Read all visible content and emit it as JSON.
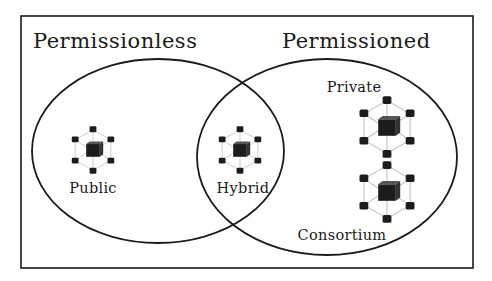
{
  "diagram": {
    "type": "venn",
    "frame": {
      "x": 21,
      "y": 16,
      "width": 452,
      "height": 252
    },
    "colors": {
      "stroke": "#1a1a1a",
      "node": "#1c1c1c",
      "link": "#bdbdbd",
      "background": "#ffffff"
    },
    "sets": [
      {
        "id": "permissionless",
        "label": "Permissionless",
        "label_x": 33,
        "label_y": 48,
        "cx": 158,
        "cy": 151,
        "rx": 126,
        "ry": 92
      },
      {
        "id": "permissioned",
        "label": "Permissioned",
        "label_x": 282,
        "label_y": 48,
        "cx": 327,
        "cy": 160,
        "rx": 130,
        "ry": 96
      }
    ],
    "items": [
      {
        "id": "public",
        "label": "Public",
        "set": "permissionless",
        "icon": "blockchain-network-icon",
        "icon_cx": 93,
        "icon_cy": 150,
        "scale": 0.85,
        "label_x": 93,
        "label_y": 192
      },
      {
        "id": "hybrid",
        "label": "Hybrid",
        "set": "intersection",
        "icon": "blockchain-network-icon",
        "icon_cx": 240,
        "icon_cy": 150,
        "scale": 0.85,
        "label_x": 243,
        "label_y": 192
      },
      {
        "id": "private",
        "label": "Private",
        "set": "permissioned",
        "icon": "blockchain-network-icon",
        "icon_cx": 387,
        "icon_cy": 126,
        "scale": 1.1,
        "label_x": 354,
        "label_y": 92
      },
      {
        "id": "consortium",
        "label": "Consortium",
        "set": "permissioned",
        "icon": "blockchain-network-icon",
        "icon_cx": 387,
        "icon_cy": 192,
        "scale": 1.1,
        "label_x": 342,
        "label_y": 240
      }
    ]
  }
}
